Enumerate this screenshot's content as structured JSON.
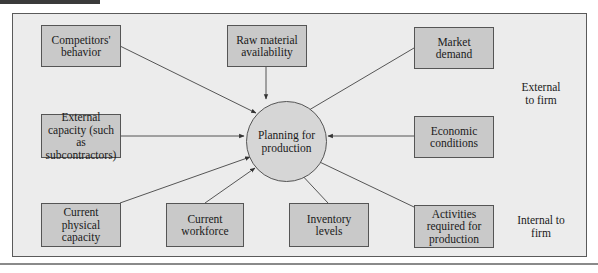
{
  "diagram": {
    "center": {
      "label": "Planning for\nproduction"
    },
    "external_inputs": [
      {
        "id": "competitors",
        "label": "Competitors'\nbehavior"
      },
      {
        "id": "raw-material",
        "label": "Raw material\navailability"
      },
      {
        "id": "market-demand",
        "label": "Market\ndemand"
      },
      {
        "id": "external-capacity",
        "label": "External\ncapacity (such as\nsubcontractors)"
      },
      {
        "id": "economic-conditions",
        "label": "Economic\nconditions"
      }
    ],
    "internal_inputs": [
      {
        "id": "physical-capacity",
        "label": "Current\nphysical\ncapacity"
      },
      {
        "id": "workforce",
        "label": "Current\nworkforce"
      },
      {
        "id": "inventory",
        "label": "Inventory\nlevels"
      },
      {
        "id": "activities",
        "label": "Activities\nrequired for\nproduction"
      }
    ],
    "side_labels": {
      "external": "External\nto firm",
      "internal": "Internal to\nfirm"
    },
    "colors": {
      "panel_bg": "#ececec",
      "box_fill": "#c9c9c9",
      "circle_fill": "#d6d6d6",
      "stroke": "#555555"
    }
  }
}
